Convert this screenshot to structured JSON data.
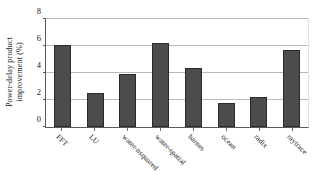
{
  "chart_data": {
    "type": "bar",
    "title": "",
    "xlabel": "",
    "ylabel_line1": "Power-delay product",
    "ylabel_line2": "improvement (%)",
    "ylabel": "Power-delay product improvement (%)",
    "categories": [
      "FFT",
      "LU",
      "water-nsquared",
      "water-spatial",
      "barnes",
      "ocean",
      "radix",
      "raytrace"
    ],
    "values": [
      6.1,
      2.55,
      3.95,
      6.25,
      4.35,
      1.8,
      2.2,
      5.7
    ],
    "ylim": [
      0,
      8
    ],
    "yticks": [
      0,
      2,
      4,
      6,
      8
    ],
    "ytick_labels": [
      "0",
      "2",
      "4",
      "6",
      "8"
    ],
    "grid": "horizontal",
    "legend": "none",
    "bar_color": "#4c4c4c",
    "bar_edge_color": "#2b2b2b",
    "axis_color": "#5a5a5a",
    "gridline_color": "#b9b9b9",
    "background_color": "#ffffff",
    "xlabel_rotation_deg": 45
  }
}
